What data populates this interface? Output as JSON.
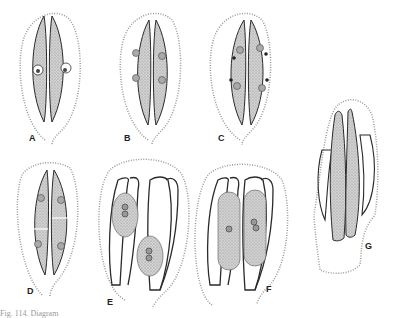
{
  "figure": {
    "panels": [
      {
        "id": "A",
        "label": "A",
        "description": "Guard cell mother cell pair with two nuclei, cells undivided"
      },
      {
        "id": "B",
        "label": "B",
        "description": "Paired elongated cells, each with two nuclei"
      },
      {
        "id": "C",
        "label": "C",
        "description": "Paired elongated cells with nuclei and dark granules"
      },
      {
        "id": "D",
        "label": "D",
        "description": "Paired cells each divided by a transverse wall, one nucleus per segment"
      },
      {
        "id": "E",
        "label": "E",
        "description": "Two rounded protoplasts with nuclei within outlined wall sacs"
      },
      {
        "id": "F",
        "label": "F",
        "description": "Two elongated protoplasts side by side within outlined wall sacs"
      },
      {
        "id": "G",
        "label": "G",
        "description": "Elongated stippled cells within irregular enclosing sheath"
      }
    ],
    "caption": "Fig. 114. Diagram"
  },
  "colors": {
    "ink": "#2a2a2a",
    "stipple": "#b8b8b8",
    "cell_fill": "#c9c9c9",
    "background": "#ffffff"
  }
}
